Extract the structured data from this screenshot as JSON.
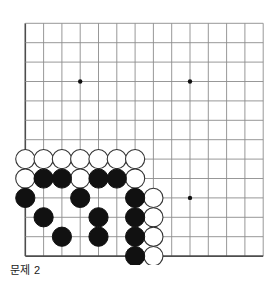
{
  "figure": {
    "kind": "go-board-problem-diagram",
    "caption": "문제 2",
    "board": {
      "columns": 14,
      "rows": 13,
      "origin_x": 25.3,
      "origin_y": 23.3,
      "step_x": 18.3,
      "step_y": 19.4,
      "line_color": "#8c8c8c",
      "edge_color": "#4d4d4d",
      "background": "#ffffff",
      "star_points": [
        {
          "col": 3,
          "row": 3
        },
        {
          "col": 9,
          "row": 3
        },
        {
          "col": 9,
          "row": 9
        }
      ],
      "star_color": "#111111",
      "stone_radius": 9.6
    },
    "stones": {
      "black_color": "#111111",
      "white_color": "#ffffff",
      "white_outline": "#333333",
      "black_count": 17,
      "white_count": 14,
      "black": [
        {
          "col": 1,
          "row": 8
        },
        {
          "col": 2,
          "row": 8
        },
        {
          "col": 4,
          "row": 8
        },
        {
          "col": 5,
          "row": 8
        },
        {
          "col": 0,
          "row": 9
        },
        {
          "col": 3,
          "row": 9
        },
        {
          "col": 6,
          "row": 9
        },
        {
          "col": 1,
          "row": 10
        },
        {
          "col": 4,
          "row": 10
        },
        {
          "col": 6,
          "row": 10
        },
        {
          "col": 2,
          "row": 11
        },
        {
          "col": 4,
          "row": 11
        },
        {
          "col": 6,
          "row": 11
        },
        {
          "col": 6,
          "row": 12
        }
      ],
      "black_extra": [
        {
          "col": 1,
          "row": 8
        },
        {
          "col": 4,
          "row": 8
        },
        {
          "col": 6,
          "row": 12
        }
      ],
      "white": [
        {
          "col": 0,
          "row": 7
        },
        {
          "col": 1,
          "row": 7
        },
        {
          "col": 2,
          "row": 7
        },
        {
          "col": 3,
          "row": 7
        },
        {
          "col": 4,
          "row": 7
        },
        {
          "col": 5,
          "row": 7
        },
        {
          "col": 6,
          "row": 7
        },
        {
          "col": 0,
          "row": 8
        },
        {
          "col": 3,
          "row": 8
        },
        {
          "col": 6,
          "row": 8
        },
        {
          "col": 7,
          "row": 9
        },
        {
          "col": 7,
          "row": 10
        },
        {
          "col": 7,
          "row": 11
        },
        {
          "col": 7,
          "row": 12
        }
      ]
    }
  }
}
